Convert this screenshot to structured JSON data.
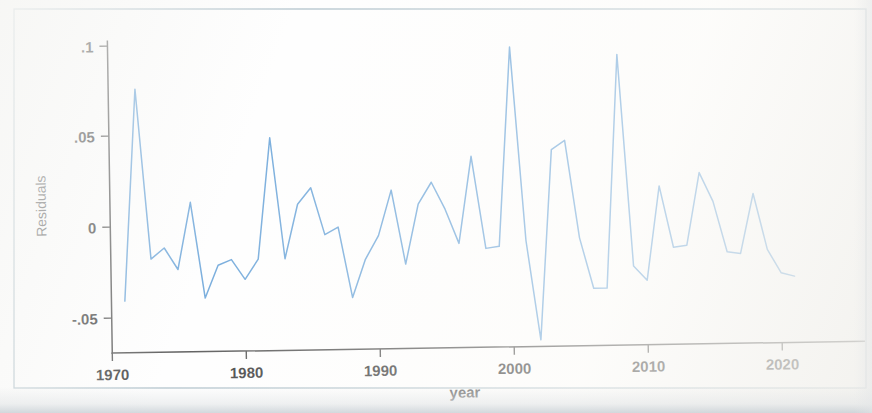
{
  "chart_data": {
    "type": "line",
    "title": "",
    "xlabel": "year",
    "ylabel": "Residuals",
    "xlim": [
      1970.5,
      2021.5
    ],
    "ylim": [
      -0.07,
      0.105
    ],
    "xticks": [
      "1970",
      "1980",
      "1990",
      "2000",
      "2010",
      "2020"
    ],
    "xtick_values": [
      1970,
      1980,
      1990,
      2000,
      2010,
      2020
    ],
    "yticks": [
      ".1",
      ".05",
      "0",
      "-.05"
    ],
    "ytick_values": [
      0.1,
      0.05,
      0,
      -0.05
    ],
    "grid": false,
    "legend": null,
    "line_color": "#5b9bd5",
    "axis_color": "#3a3a3a",
    "series": [
      {
        "name": "Residuals",
        "x": [
          1971,
          1972,
          1973,
          1974,
          1975,
          1976,
          1977,
          1978,
          1979,
          1980,
          1981,
          1982,
          1983,
          1984,
          1985,
          1986,
          1987,
          1988,
          1989,
          1990,
          1991,
          1992,
          1993,
          1994,
          1995,
          1996,
          1997,
          1998,
          1999,
          2000,
          2001,
          2002,
          2003,
          2004,
          2005,
          2006,
          2007,
          2008,
          2009,
          2010,
          2011,
          2012,
          2013,
          2014,
          2015,
          2016,
          2017,
          2018,
          2019,
          2020,
          2021
        ],
        "values": [
          -0.041,
          0.076,
          -0.018,
          -0.012,
          -0.024,
          0.013,
          -0.04,
          -0.022,
          -0.019,
          -0.03,
          -0.019,
          0.048,
          -0.019,
          0.011,
          0.02,
          -0.006,
          -0.002,
          -0.041,
          -0.02,
          -0.007,
          0.018,
          -0.023,
          0.01,
          0.022,
          0.007,
          -0.012,
          0.036,
          -0.015,
          -0.014,
          0.096,
          -0.011,
          -0.066,
          0.039,
          0.044,
          -0.01,
          -0.038,
          -0.038,
          0.091,
          -0.026,
          -0.034,
          0.018,
          -0.016,
          -0.015,
          0.025,
          0.009,
          -0.019,
          -0.02,
          0.013,
          -0.018,
          -0.031,
          -0.033
        ]
      }
    ]
  },
  "axis": {
    "y_title": "Residuals",
    "x_title": "year"
  }
}
